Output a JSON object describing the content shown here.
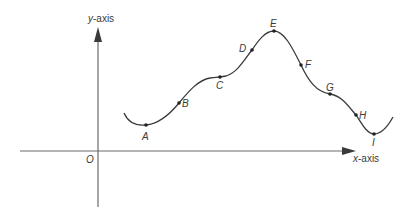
{
  "diagram": {
    "axes": {
      "x_label_var": "x",
      "x_label_suffix": "-axis",
      "y_label_var": "y",
      "y_label_suffix": "-axis",
      "origin_label": "O"
    },
    "curve": {
      "description": "Smooth wavy curve above the x-axis with a local minimum, an inflection/plateau, a maximum, a plateau, and another local minimum",
      "points": [
        {
          "label": "A",
          "note": "local minimum"
        },
        {
          "label": "B",
          "note": "rising"
        },
        {
          "label": "C",
          "note": "plateau / stationary inflection"
        },
        {
          "label": "D",
          "note": "rising"
        },
        {
          "label": "E",
          "note": "local maximum"
        },
        {
          "label": "F",
          "note": "falling"
        },
        {
          "label": "G",
          "note": "plateau / stationary inflection"
        },
        {
          "label": "H",
          "note": "falling"
        },
        {
          "label": "I",
          "note": "local minimum"
        }
      ]
    },
    "colors": {
      "line": "#3a3a3a",
      "axis": "#6a6a6a",
      "background": "#ffffff"
    }
  }
}
